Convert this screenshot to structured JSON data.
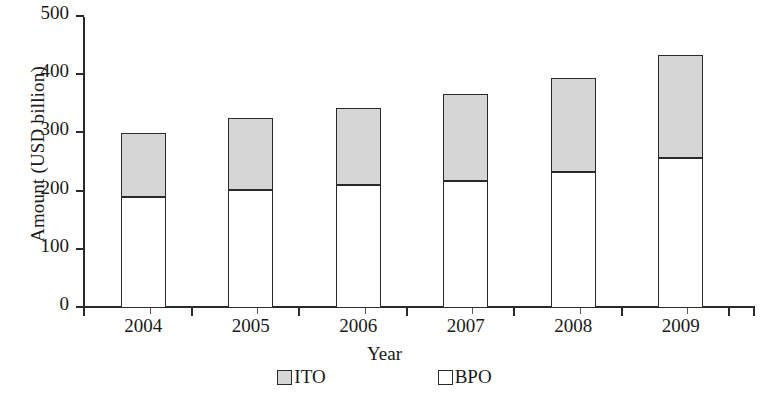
{
  "chart_data": {
    "type": "bar",
    "subtype": "stacked-vertical",
    "title": "",
    "xlabel": "Year",
    "ylabel": "Amount (USD billion)",
    "categories": [
      "2004",
      "2005",
      "2006",
      "2007",
      "2008",
      "2009"
    ],
    "series": [
      {
        "name": "BPO",
        "values": [
          190,
          202,
          211,
          219,
          233,
          257
        ],
        "color": "#ffffff",
        "stack_order": 0
      },
      {
        "name": "ITO",
        "values": [
          110,
          125,
          133,
          149,
          162,
          178
        ],
        "color": "#d6d6d6",
        "stack_order": 1
      }
    ],
    "totals": [
      300,
      327,
      344,
      368,
      395,
      435
    ],
    "ylim": [
      0,
      500
    ],
    "ytick_values": [
      0,
      100,
      200,
      300,
      400,
      500
    ],
    "ytick_labels": [
      "0",
      "100",
      "200",
      "300",
      "400",
      "500"
    ],
    "grid": false,
    "legend_position": "bottom",
    "legend_entries": [
      {
        "label": "ITO",
        "swatch": "ito"
      },
      {
        "label": "BPO",
        "swatch": "bpo"
      }
    ]
  },
  "axis": {
    "y_title": "Amount (USD billion)",
    "x_title": "Year"
  },
  "colors": {
    "ito_fill": "#d6d6d6",
    "bpo_fill": "#ffffff",
    "stroke": "#2a2a2a",
    "background": "#ffffff"
  }
}
